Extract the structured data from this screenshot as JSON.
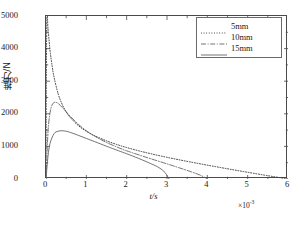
{
  "chart_data": {
    "type": "line",
    "title": "",
    "xlabel": "t/s",
    "ylabel": "推力/N",
    "x_exponent_prefix": "×10",
    "x_exponent_value": "-3",
    "xlim": [
      0,
      6
    ],
    "ylim": [
      0,
      5000
    ],
    "xticks": [
      0,
      1,
      2,
      3,
      4,
      5,
      6
    ],
    "yticks": [
      0,
      1000,
      2000,
      3000,
      4000,
      5000
    ],
    "xticklabels": [
      "0",
      "1",
      "2",
      "3",
      "4",
      "5",
      "6"
    ],
    "yticklabels": [
      "0",
      "1000",
      "2000",
      "3000",
      "4000",
      "5000"
    ],
    "grid": false,
    "legend_position": "top-right",
    "series": [
      {
        "name": "5mm",
        "linestyle": "dotted",
        "color": "#3a3a3a",
        "peak_x": 0.03,
        "peak_y": 4950,
        "zero_crossing_x": 6.0,
        "x": [
          0,
          0.02,
          0.05,
          0.1,
          0.15,
          0.2,
          0.3,
          0.4,
          0.5,
          0.6,
          0.8,
          1.0,
          1.2,
          1.5,
          1.8,
          2.0,
          2.3,
          2.6,
          3.0,
          3.4,
          3.8,
          4.2,
          4.6,
          5.0,
          5.4,
          5.7,
          5.9,
          6.0
        ],
        "y": [
          700,
          4950,
          4600,
          3950,
          3480,
          3120,
          2620,
          2290,
          2060,
          1890,
          1640,
          1465,
          1330,
          1170,
          1040,
          965,
          865,
          775,
          665,
          565,
          470,
          380,
          292,
          206,
          122,
          62,
          22,
          0
        ]
      },
      {
        "name": "10mm",
        "linestyle": "dashdot",
        "color": "#5a5a5a",
        "peak_x": 0.25,
        "peak_y": 2350,
        "zero_crossing_x": 4.0,
        "x": [
          0,
          0.05,
          0.1,
          0.15,
          0.2,
          0.25,
          0.3,
          0.4,
          0.5,
          0.6,
          0.8,
          1.0,
          1.2,
          1.5,
          1.8,
          2.0,
          2.3,
          2.6,
          3.0,
          3.3,
          3.6,
          3.8,
          3.95,
          4.0
        ],
        "y": [
          0,
          1450,
          2030,
          2270,
          2345,
          2350,
          2320,
          2200,
          2060,
          1925,
          1680,
          1480,
          1320,
          1120,
          960,
          865,
          740,
          620,
          465,
          345,
          220,
          130,
          40,
          0
        ]
      },
      {
        "name": "15mm",
        "linestyle": "solid",
        "color": "#5a5a5a",
        "peak_x": 0.4,
        "peak_y": 1480,
        "zero_crossing_x": 3.05,
        "x": [
          0,
          0.05,
          0.1,
          0.2,
          0.3,
          0.4,
          0.5,
          0.6,
          0.8,
          1.0,
          1.2,
          1.5,
          1.8,
          2.0,
          2.3,
          2.6,
          2.8,
          2.95,
          3.05
        ],
        "y": [
          0,
          700,
          1090,
          1390,
          1465,
          1480,
          1465,
          1430,
          1340,
          1245,
          1150,
          1005,
          865,
          775,
          630,
          470,
          350,
          200,
          0
        ]
      }
    ]
  },
  "legend": {
    "items": [
      {
        "label": "5mm"
      },
      {
        "label": "10mm"
      },
      {
        "label": "15mm"
      }
    ]
  },
  "caption": {
    "text": ""
  }
}
